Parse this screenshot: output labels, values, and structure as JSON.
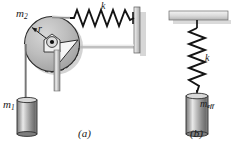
{
  "figure": {
    "background": "#ffffff",
    "ink": "#1a1a1a"
  },
  "panels": [
    {
      "id": "a",
      "caption": "(a)",
      "caption_x": 78,
      "caption_y": 128,
      "description": "Mass m1 hangs from a cord over a pulley of mass m2 and radius r; a horizontal spring of stiffness k connects the pulley to a wall.",
      "labels": [
        {
          "name": "pulley-mass-label",
          "text": "m",
          "sub": "2",
          "x": 16,
          "y": 8
        },
        {
          "name": "radius-label",
          "text": "r",
          "sub": "",
          "x": 38,
          "y": 24
        },
        {
          "name": "spring-constant-label",
          "text": "k",
          "sub": "",
          "x": 101,
          "y": 1
        },
        {
          "name": "hanging-mass-label",
          "text": "m",
          "sub": "1",
          "x": 3,
          "y": 99
        }
      ],
      "parts": {
        "pulley": {
          "cx": 52,
          "cy": 44,
          "r": 28,
          "fill": "#b9b9b9",
          "stroke": "#2a2a2a"
        },
        "hub": {
          "cx": 52,
          "cy": 44,
          "r": 5,
          "fill": "#d8d8d8"
        },
        "axle_dot": {
          "cx": 52,
          "cy": 44,
          "r": 2,
          "fill": "#111111"
        },
        "spring": {
          "coils": 9,
          "x1": 76,
          "x2": 134,
          "y": 18,
          "amplitude": 8
        },
        "wall": {
          "x": 136,
          "y1": 8,
          "y2": 52,
          "fill": "#cfcfcf"
        },
        "support_rod": {
          "x": 57,
          "y1": 50,
          "y2": 90,
          "fill": "#c4c4c4"
        },
        "cord": {
          "x": 26,
          "y1": 44,
          "y2": 100
        },
        "block": {
          "x": 18,
          "y": 100,
          "w": 20,
          "h": 34,
          "fill_light": "#eeeeee",
          "fill_dark": "#6f6f6f"
        }
      }
    },
    {
      "id": "b",
      "caption": "(b)",
      "caption_x": 190,
      "caption_y": 128,
      "description": "A single effective mass m_eff hanging from a vertical spring of stiffness k attached to a ceiling.",
      "labels": [
        {
          "name": "spring-constant-label",
          "text": "k",
          "sub": "",
          "x": 205,
          "y": 53
        },
        {
          "name": "effective-mass-label",
          "text": "m",
          "sub": "eff",
          "x": 200,
          "y": 99
        }
      ],
      "parts": {
        "ceiling": {
          "x": 170,
          "y": 10,
          "w": 58,
          "h": 8,
          "fill": "#d4d4d4"
        },
        "spring": {
          "coils": 9,
          "y1": 24,
          "y2": 88,
          "x": 197,
          "amplitude": 8
        },
        "block": {
          "x": 186,
          "y": 96,
          "w": 22,
          "h": 38,
          "fill_light": "#eeeeee",
          "fill_dark": "#6f6f6f"
        }
      }
    }
  ],
  "captions": {
    "panel_a": "(a)",
    "panel_b": "(b)"
  },
  "symbols": {
    "m2": "m",
    "m2_sub": "2",
    "m1": "m",
    "m1_sub": "1",
    "r": "r",
    "k": "k",
    "meff": "m",
    "meff_sub": "eff"
  }
}
